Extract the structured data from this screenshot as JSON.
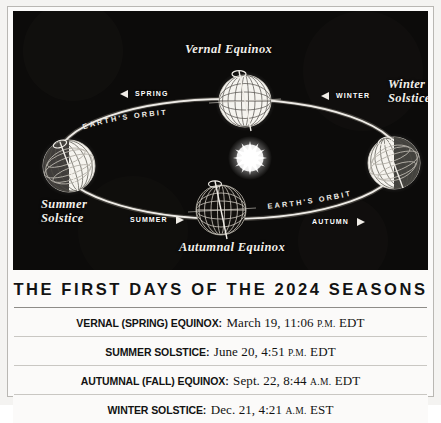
{
  "diagram": {
    "sun_label": "sun",
    "orbit_labels": [
      "EARTH'S ORBIT",
      "EARTH'S ORBIT"
    ],
    "positions": [
      {
        "id": "vernal",
        "label": "Vernal Equinox",
        "lines": [
          "Vernal Equinox"
        ]
      },
      {
        "id": "winter",
        "label": "Winter Solstice",
        "lines": [
          "Winter",
          "Solstice"
        ]
      },
      {
        "id": "autumnal",
        "label": "Autumnal Equinox",
        "lines": [
          "Autumnal Equinox"
        ]
      },
      {
        "id": "summer",
        "label": "Summer Solstice",
        "lines": [
          "Summer",
          "Solstice"
        ]
      }
    ],
    "seasons": [
      {
        "id": "spring",
        "label": "SPRING",
        "direction": "left"
      },
      {
        "id": "winter",
        "label": "WINTER",
        "direction": "left"
      },
      {
        "id": "summer",
        "label": "SUMMER",
        "direction": "right"
      },
      {
        "id": "autumn",
        "label": "AUTUMN",
        "direction": "right"
      }
    ],
    "colors": {
      "background": "#0c0b0a",
      "ink": "#f2efe9",
      "globe": "#ffffff"
    }
  },
  "table": {
    "title": "THE FIRST DAYS OF THE 2024 SEASONS",
    "rows": [
      {
        "label": "VERNAL (SPRING) EQUINOX:",
        "date": "March 19, 11:06",
        "meridiem": "P.M.",
        "zone": "EDT"
      },
      {
        "label": "SUMMER SOLSTICE:",
        "date": "June 20, 4:51",
        "meridiem": "P.M.",
        "zone": "EDT"
      },
      {
        "label": "AUTUMNAL (FALL) EQUINOX:",
        "date": "Sept. 22, 8:44",
        "meridiem": "A.M.",
        "zone": "EDT"
      },
      {
        "label": "WINTER SOLSTICE:",
        "date": "Dec. 21, 4:21",
        "meridiem": "A.M.",
        "zone": "EST"
      }
    ]
  }
}
